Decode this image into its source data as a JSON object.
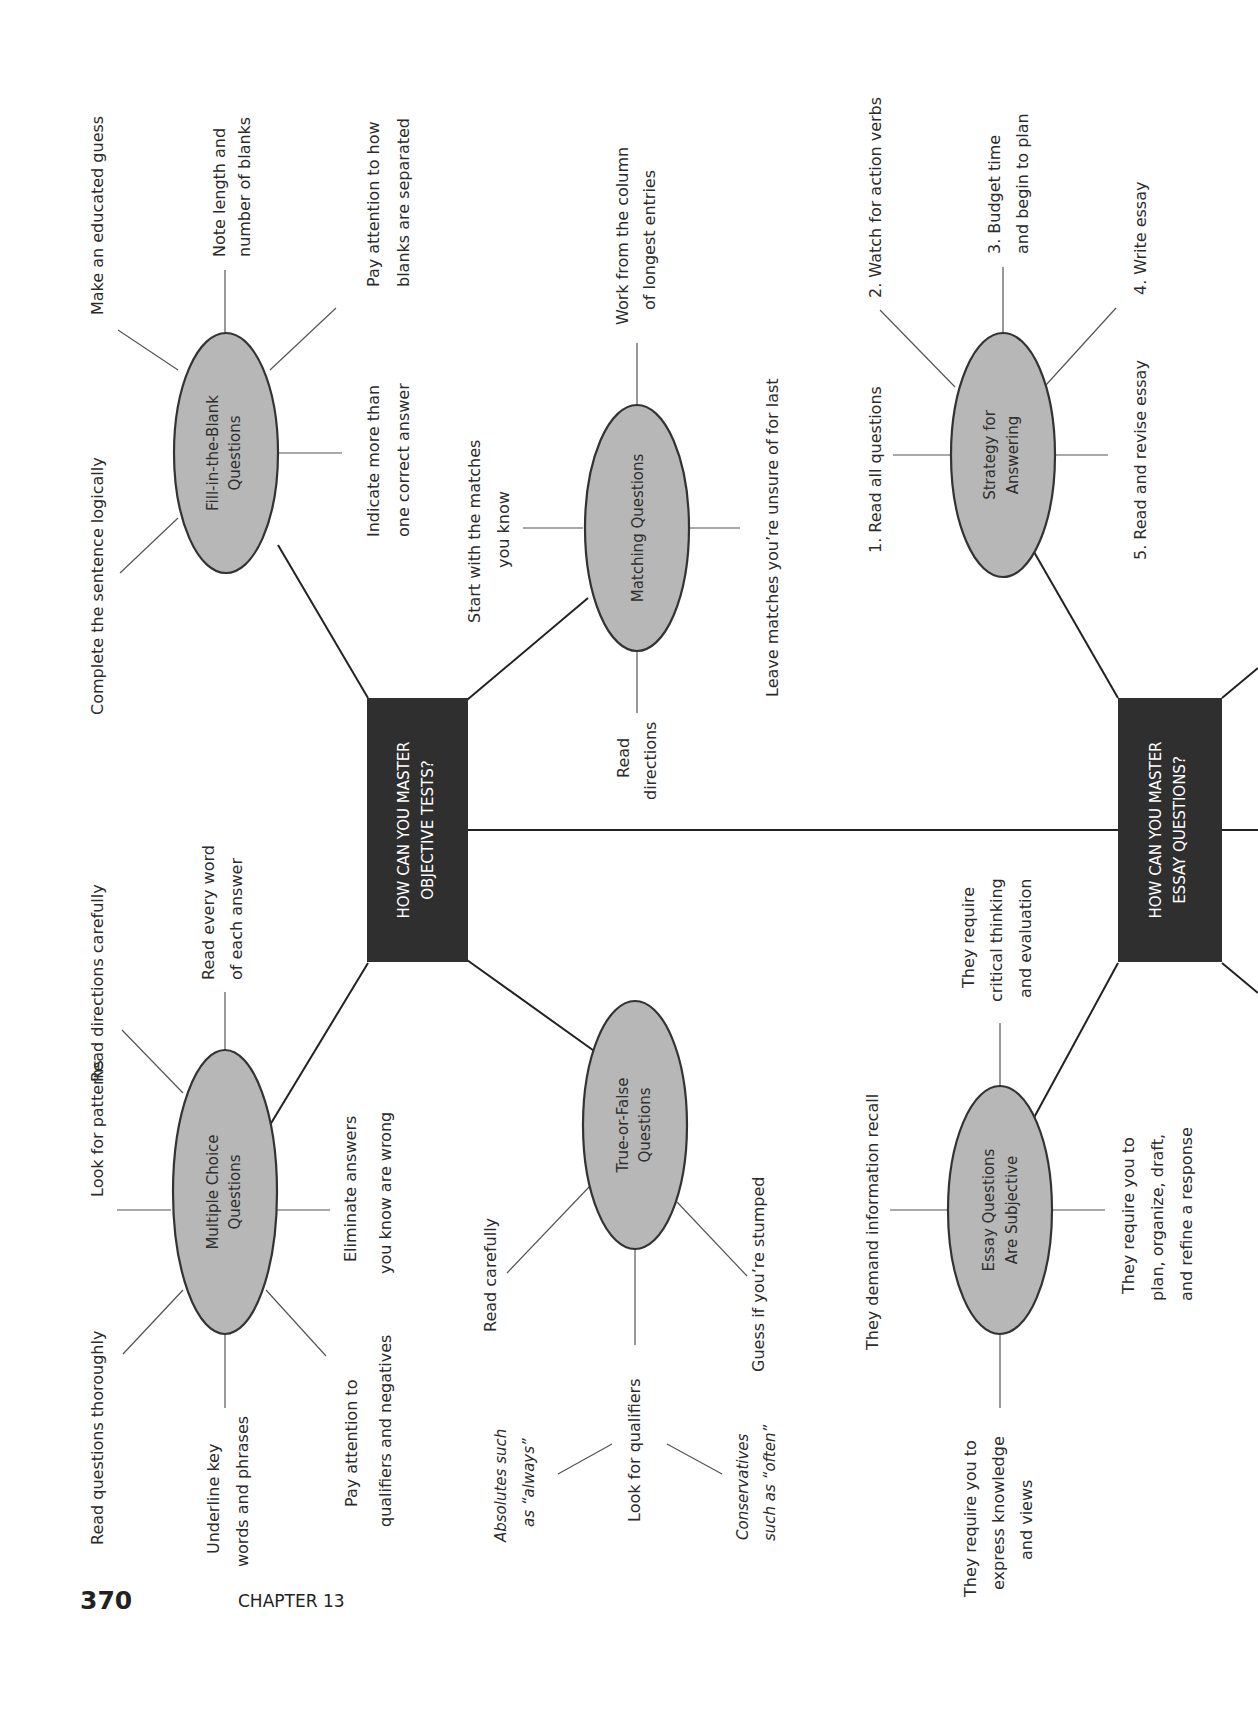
{
  "page": {
    "number": "370",
    "chapter": "CHAPTER 13"
  },
  "hubs": {
    "objective": {
      "line1": "HOW CAN YOU MASTER",
      "line2": "OBJECTIVE TESTS?"
    },
    "essay": {
      "line1": "HOW CAN YOU MASTER",
      "line2": "ESSAY QUESTIONS?"
    }
  },
  "nodes": {
    "fill_in_blank": {
      "line1": "Fill-in-the-Blank",
      "line2": "Questions",
      "leaves": [
        {
          "lines": [
            "Complete the sentence logically"
          ]
        },
        {
          "lines": [
            "Make an educated guess"
          ]
        },
        {
          "lines": [
            "Note length and",
            "number of blanks"
          ]
        },
        {
          "lines": [
            "Pay attention to how",
            "blanks are separated"
          ]
        },
        {
          "lines": [
            "Indicate more than",
            "one correct answer"
          ]
        }
      ]
    },
    "matching": {
      "line1": "Matching Questions",
      "leaves": [
        {
          "lines": [
            "Start with the matches",
            "you know"
          ]
        },
        {
          "lines": [
            "Work from the column",
            "of longest entries"
          ]
        },
        {
          "lines": [
            "Leave matches you’re unsure of for last"
          ]
        },
        {
          "lines": [
            "Read",
            "directions"
          ]
        }
      ]
    },
    "multiple_choice": {
      "line1": "Multiple Choice",
      "line2": "Questions",
      "leaves": [
        {
          "lines": [
            "Read questions thoroughly"
          ]
        },
        {
          "lines": [
            "Look for patterns"
          ]
        },
        {
          "lines": [
            "Read directions carefully"
          ]
        },
        {
          "lines": [
            "Read every word",
            "of each answer"
          ]
        },
        {
          "lines": [
            "Eliminate answers",
            "you know are wrong"
          ]
        },
        {
          "lines": [
            "Pay attention to",
            "qualifiers and negatives"
          ]
        },
        {
          "lines": [
            "Underline key",
            "words and phrases"
          ]
        }
      ]
    },
    "true_false": {
      "line1": "True-or-False",
      "line2": "Questions",
      "leaves": [
        {
          "lines": [
            "Read carefully"
          ]
        },
        {
          "lines": [
            "Look for qualifiers"
          ]
        },
        {
          "lines": [
            "Guess if you’re stumped"
          ]
        }
      ],
      "sub_leaves": [
        {
          "lines": [
            "Absolutes such",
            "as “always”"
          ]
        },
        {
          "lines": [
            "Conservatives",
            "such as “often”"
          ]
        }
      ]
    },
    "strategy": {
      "line1": "Strategy for",
      "line2": "Answering",
      "leaves": [
        {
          "lines": [
            "1.  Read all questions"
          ]
        },
        {
          "lines": [
            "2.  Watch for action verbs"
          ]
        },
        {
          "lines": [
            "3.  Budget time",
            "and begin to plan"
          ]
        },
        {
          "lines": [
            "4.  Write essay"
          ]
        },
        {
          "lines": [
            "5.  Read and revise essay"
          ]
        }
      ]
    },
    "essay_subjective": {
      "line1": "Essay Questions",
      "line2": "Are Subjective",
      "leaves": [
        {
          "lines": [
            "They demand information recall"
          ]
        },
        {
          "lines": [
            "They require",
            "critical thinking",
            "and evaluation"
          ]
        },
        {
          "lines": [
            "They require you to",
            "plan, organize, draft,",
            "and refine a response"
          ]
        },
        {
          "lines": [
            "They require you to",
            "express knowledge",
            "and views"
          ]
        }
      ]
    }
  },
  "colors": {
    "hub_fill": "#2f2f2f",
    "oval_fill": "#b7b7b7",
    "line": "#333333",
    "text": "#2b2b2b"
  }
}
